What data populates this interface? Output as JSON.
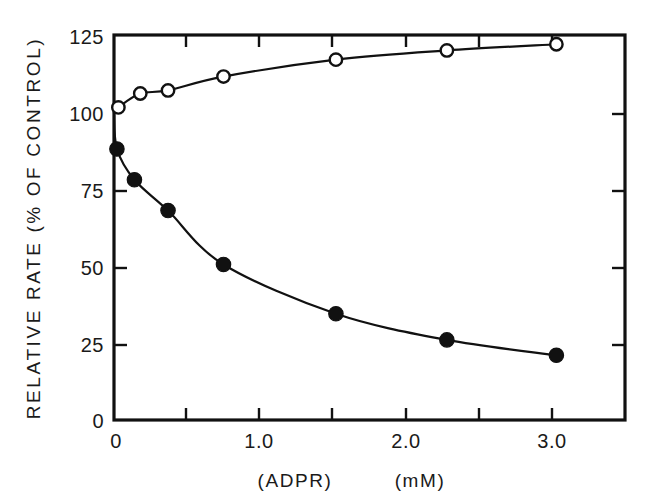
{
  "chart_data": {
    "type": "line",
    "title": "",
    "subtitle": "",
    "xlabel": "(ADPR)   (mM)",
    "xlabel_parts": [
      "(ADPR)",
      "(mM)"
    ],
    "ylabel": "RELATIVE RATE  (% OF CONTROL)",
    "xlim": [
      0,
      3.5
    ],
    "ylim": [
      0,
      125
    ],
    "grid": false,
    "legend": "none",
    "x_ticks_major": [
      0,
      1.0,
      2.0,
      3.0
    ],
    "x_ticks_all": [
      0,
      0.5,
      1.0,
      1.5,
      2.0,
      2.5,
      3.0
    ],
    "x_tick_labels": [
      "0",
      "1.0",
      "2.0",
      "3.0"
    ],
    "y_ticks": [
      0,
      25,
      50,
      75,
      100,
      125
    ],
    "y_tick_labels": [
      "0",
      "25",
      "50",
      "75",
      "100",
      "125"
    ],
    "series": [
      {
        "name": "open-circles-activation",
        "marker": "open-circle",
        "x": [
          0.03,
          0.18,
          0.37,
          0.75,
          1.52,
          2.28,
          3.03
        ],
        "values": [
          101.5,
          106.0,
          107.0,
          111.5,
          117.0,
          120.0,
          122.0
        ]
      },
      {
        "name": "filled-circles-inhibition",
        "marker": "filled-circle",
        "x": [
          0.02,
          0.14,
          0.37,
          0.75,
          1.52,
          2.28,
          3.03
        ],
        "values": [
          88.0,
          78.0,
          68.0,
          50.5,
          34.5,
          26.0,
          21.0
        ]
      }
    ],
    "origin_point": {
      "x": 0,
      "y": 100
    },
    "colors": {
      "axis": "#111111",
      "line": "#111111",
      "filled_marker": "#111111",
      "open_marker_fill": "#ffffff",
      "background": "#ffffff"
    }
  },
  "axis_labels": {
    "y_title": "RELATIVE RATE  (% OF CONTROL)",
    "x_title_analyte": "(ADPR)",
    "x_title_units": "(mM)"
  },
  "y_labels": {
    "t125": "125",
    "t100": "100",
    "t75": "75",
    "t50": "50",
    "t25": "25",
    "t0": "0"
  },
  "x_labels": {
    "t0": "0",
    "t1": "1.0",
    "t2": "2.0",
    "t3": "3.0"
  }
}
